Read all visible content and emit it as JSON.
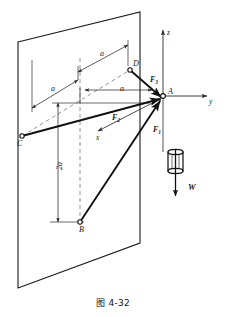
{
  "figure": {
    "caption": "图 4-32",
    "kind": "3d-statics-free-body-diagram",
    "colors": {
      "stroke": "#1a1a1a",
      "thin_stroke": "#3a3a3a",
      "background": "#ffffff",
      "dashed": "#6a6a6a"
    },
    "axes": [
      {
        "name": "z-axis",
        "label": "z",
        "direction": "up"
      },
      {
        "name": "y-axis",
        "label": "y",
        "direction": "right"
      },
      {
        "name": "x-axis",
        "label": "x",
        "direction": "toward-viewer-lower-left"
      }
    ],
    "points": [
      {
        "name": "point-a",
        "label": "A",
        "note": "origin / junction of cables"
      },
      {
        "name": "point-b",
        "label": "B",
        "note": "lower attachment on wall"
      },
      {
        "name": "point-c",
        "label": "C",
        "note": "left attachment on wall"
      },
      {
        "name": "point-d",
        "label": "D",
        "note": "upper attachment on wall"
      }
    ],
    "forces": [
      {
        "name": "force-f1",
        "label": "F",
        "subscript": "1",
        "from": "B",
        "to": "A"
      },
      {
        "name": "force-f2",
        "label": "F",
        "subscript": "2",
        "from": "C",
        "to": "A"
      },
      {
        "name": "force-f3",
        "label": "F",
        "subscript": "3",
        "from": "D",
        "to": "A"
      },
      {
        "name": "weight-w",
        "label": "W",
        "direction": "downward",
        "note": "suspended block weight"
      }
    ],
    "dimensions": [
      {
        "name": "dim-a-upper",
        "label": "a"
      },
      {
        "name": "dim-a-left",
        "label": "a"
      },
      {
        "name": "dim-a-inner",
        "label": "a"
      },
      {
        "name": "dim-2a-vertical",
        "label": "2a"
      }
    ]
  }
}
